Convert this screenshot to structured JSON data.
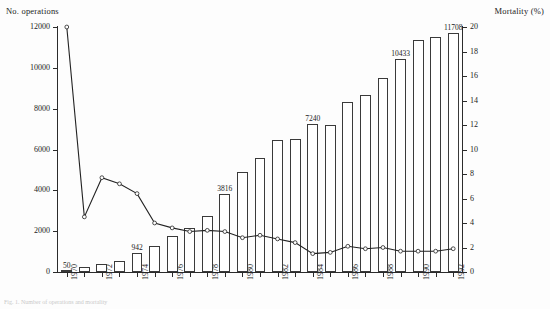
{
  "figure": {
    "left_axis_title": "No. operations",
    "right_axis_title": "Mortality (%)",
    "caption": "Fig. 1. Number of operations and mortality"
  },
  "chart_data": {
    "type": "bar",
    "title": "",
    "xlabel": "",
    "ylabel": "No. operations",
    "y2label": "Mortality (%)",
    "ylim": [
      0,
      12000
    ],
    "y2lim": [
      0,
      20
    ],
    "yticks": [
      0,
      2000,
      4000,
      6000,
      8000,
      10000,
      12000
    ],
    "y2ticks": [
      0,
      2,
      4,
      6,
      8,
      10,
      12,
      14,
      16,
      18,
      20
    ],
    "grid": false,
    "legend": "none",
    "categories": [
      "1970",
      "1971",
      "1972",
      "1973",
      "1974",
      "1975",
      "1976",
      "1977",
      "1978",
      "1979",
      "1980",
      "1981",
      "1982",
      "1983",
      "1984",
      "1985",
      "1986",
      "1987",
      "1988",
      "1989",
      "1990",
      "1991",
      "1992"
    ],
    "xtick_labels": [
      "1970",
      "1972",
      "1974",
      "1976",
      "1978",
      "1980",
      "1982",
      "1984",
      "1986",
      "1988",
      "1990",
      "1992"
    ],
    "series": [
      {
        "name": "No. operations",
        "type": "bar",
        "axis": "left",
        "values": [
          50,
          230,
          390,
          560,
          942,
          1290,
          1760,
          2180,
          2760,
          3816,
          4880,
          5560,
          6480,
          6500,
          7240,
          7180,
          8330,
          8650,
          9500,
          10433,
          11380,
          11520,
          11708
        ],
        "point_labels": {
          "1970": "50",
          "1974": "942",
          "1979": "3816",
          "1984": "7240",
          "1989": "10433",
          "1992": "11708"
        }
      },
      {
        "name": "Mortality (%)",
        "type": "line",
        "axis": "right",
        "marker": "open-circle",
        "values": [
          20.0,
          4.5,
          7.7,
          7.2,
          6.4,
          4.0,
          3.6,
          3.3,
          3.4,
          3.3,
          2.8,
          3.0,
          2.7,
          2.4,
          1.5,
          1.6,
          2.1,
          1.9,
          2.0,
          1.7,
          1.7,
          1.7,
          1.9
        ]
      }
    ]
  }
}
